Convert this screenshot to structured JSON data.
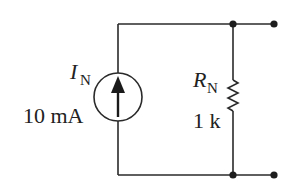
{
  "diagram": {
    "colors": {
      "line": "#2a2a2a",
      "text": "#222222",
      "background": "#ffffff"
    },
    "source": {
      "symbol": "I",
      "subscript": "N",
      "value": "10 mA",
      "type": "current-source",
      "direction": "up"
    },
    "resistor": {
      "symbol": "R",
      "subscript": "N",
      "value": "1 k"
    },
    "terminals": [
      "top-terminal",
      "bottom-terminal"
    ]
  }
}
